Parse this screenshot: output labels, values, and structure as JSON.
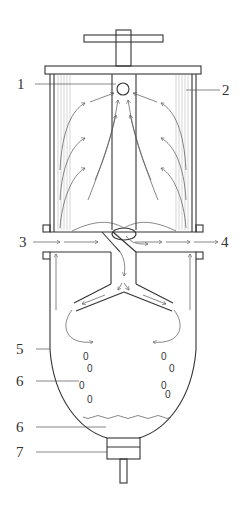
{
  "diagram": {
    "type": "technical-cross-section",
    "colors": {
      "line": "#333333",
      "hatch": "#bbbbbb",
      "background": "#ffffff"
    },
    "labels": [
      {
        "id": "1",
        "text": "1",
        "x": 27,
        "y": 89,
        "target": "top outlet orifice (circle)"
      },
      {
        "id": "2",
        "text": "2",
        "x": 228,
        "y": 96,
        "target": "filter element (hatched wall)"
      },
      {
        "id": "3",
        "text": "3",
        "x": 27,
        "y": 245,
        "target": "inlet"
      },
      {
        "id": "4",
        "text": "4",
        "x": 224,
        "y": 245,
        "target": "outlet"
      },
      {
        "id": "5",
        "text": "5",
        "x": 27,
        "y": 354,
        "target": "lower vessel shell"
      },
      {
        "id": "6a",
        "text": "6",
        "x": 27,
        "y": 386,
        "target": "droplets"
      },
      {
        "id": "6b",
        "text": "6",
        "x": 27,
        "y": 432,
        "target": "collected liquid"
      },
      {
        "id": "7",
        "text": "7",
        "x": 27,
        "y": 457,
        "target": "drain valve"
      }
    ],
    "droplet_glyph": "0"
  }
}
